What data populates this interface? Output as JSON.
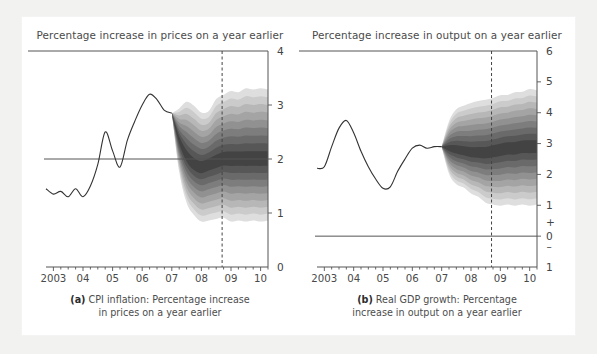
{
  "figure": {
    "background_color": "#ffffff",
    "outer_color": "#ededeb",
    "text_color": "#4a4a4a",
    "line_color": "#3a3a3a",
    "fan_dark": "#2d2d2d",
    "fan_light": "#d9d9d9"
  },
  "panels": [
    {
      "id": "a",
      "title": "Percentage increase in prices on a year earlier",
      "caption_line1_bold": "(a)",
      "caption_line1": "CPI inflation: Percentage increase",
      "caption_line2": "in prices on a year earlier",
      "y_axis_side": "right",
      "y_ticks": [
        "4",
        "3",
        "2",
        "1",
        "0"
      ],
      "x_ticks": [
        "2003",
        "04",
        "05",
        "06",
        "07",
        "08",
        "09",
        "10"
      ]
    },
    {
      "id": "b",
      "title": "Percentage increase in output on a year earlier",
      "caption_line1_bold": "(b)",
      "caption_line1": "Real GDP growth: Percentage",
      "caption_line2": "increase in output on a year earlier",
      "y_axis_side": "right",
      "y_ticks": [
        "6",
        "5",
        "4",
        "3",
        "2",
        "1",
        "+",
        "0",
        "–",
        "1"
      ],
      "x_ticks": [
        "2003",
        "04",
        "05",
        "06",
        "07",
        "08",
        "09",
        "10"
      ]
    }
  ],
  "chart_data": [
    {
      "type": "area",
      "panel": "a",
      "title": "Percentage increase in prices on a year earlier",
      "subtitle": "(a) CPI inflation: Percentage increase in prices on a year earlier",
      "xlabel": "",
      "ylabel": "Percentage increase in prices on a year earlier",
      "ylim": [
        0,
        4
      ],
      "xlim": [
        2002.75,
        2010.25
      ],
      "yticks": [
        0,
        1,
        2,
        3,
        4
      ],
      "xticks": [
        2003,
        2004,
        2005,
        2006,
        2007,
        2008,
        2009,
        2010
      ],
      "xtick_labels": [
        "2003",
        "04",
        "05",
        "06",
        "07",
        "08",
        "09",
        "10"
      ],
      "grid": false,
      "legend": "none",
      "reference_line_y": 2,
      "vertical_marker_x": 2008.7,
      "history": {
        "name": "CPI inflation (outturn)",
        "x": [
          2002.75,
          2003.0,
          2003.25,
          2003.5,
          2003.75,
          2004.0,
          2004.25,
          2004.5,
          2004.75,
          2005.0,
          2005.25,
          2005.5,
          2005.75,
          2006.0,
          2006.25,
          2006.5,
          2006.75,
          2007.0
        ],
        "y": [
          1.45,
          1.35,
          1.4,
          1.3,
          1.45,
          1.3,
          1.5,
          1.9,
          2.5,
          2.15,
          1.85,
          2.35,
          2.7,
          3.0,
          3.2,
          3.1,
          2.9,
          2.85
        ]
      },
      "fan": {
        "name": "CPI inflation projection",
        "x": [
          2007.0,
          2007.25,
          2007.5,
          2007.75,
          2008.0,
          2008.25,
          2008.5,
          2008.75,
          2009.0,
          2009.25,
          2009.5,
          2009.75,
          2010.0,
          2010.25
        ],
        "central": [
          2.85,
          2.35,
          2.05,
          1.9,
          1.85,
          1.9,
          1.95,
          2.0,
          2.0,
          2.0,
          2.0,
          2.0,
          2.0,
          2.0
        ],
        "bands_outer_upper": [
          2.85,
          2.95,
          3.05,
          3.0,
          2.85,
          2.9,
          3.1,
          3.2,
          3.25,
          3.25,
          3.3,
          3.3,
          3.3,
          3.3
        ],
        "bands_outer_lower": [
          2.85,
          1.75,
          1.2,
          0.95,
          0.85,
          0.85,
          0.9,
          0.9,
          0.85,
          0.85,
          0.85,
          0.85,
          0.85,
          0.85
        ],
        "band_count": 9
      }
    },
    {
      "type": "area",
      "panel": "b",
      "title": "Percentage increase in output on a year earlier",
      "subtitle": "(b) Real GDP growth: Percentage increase in output on a year earlier",
      "xlabel": "",
      "ylabel": "Percentage increase in output on a year earlier",
      "ylim": [
        -1,
        6
      ],
      "xlim": [
        2002.75,
        2010.25
      ],
      "yticks": [
        -1,
        0,
        1,
        2,
        3,
        4,
        5,
        6
      ],
      "ytick_labels": [
        "1",
        "0",
        "1",
        "2",
        "3",
        "4",
        "5",
        "6"
      ],
      "xticks": [
        2003,
        2004,
        2005,
        2006,
        2007,
        2008,
        2009,
        2010
      ],
      "xtick_labels": [
        "2003",
        "04",
        "05",
        "06",
        "07",
        "08",
        "09",
        "10"
      ],
      "grid": false,
      "legend": "none",
      "reference_line_y": 0,
      "vertical_marker_x": 2008.7,
      "history": {
        "name": "Real GDP growth (outturn)",
        "x": [
          2002.75,
          2003.0,
          2003.25,
          2003.5,
          2003.75,
          2004.0,
          2004.25,
          2004.5,
          2004.75,
          2005.0,
          2005.25,
          2005.5,
          2005.75,
          2006.0,
          2006.25,
          2006.5,
          2006.75,
          2007.0
        ],
        "y": [
          2.2,
          2.25,
          2.9,
          3.5,
          3.75,
          3.35,
          2.75,
          2.25,
          1.85,
          1.55,
          1.6,
          2.1,
          2.5,
          2.85,
          2.95,
          2.85,
          2.9,
          2.9
        ]
      },
      "fan": {
        "name": "Real GDP growth projection",
        "x": [
          2007.0,
          2007.25,
          2007.5,
          2007.75,
          2008.0,
          2008.25,
          2008.5,
          2008.75,
          2009.0,
          2009.25,
          2009.5,
          2009.75,
          2010.0,
          2010.25
        ],
        "central": [
          2.9,
          2.85,
          2.8,
          2.75,
          2.7,
          2.7,
          2.7,
          2.75,
          2.8,
          2.85,
          2.85,
          2.9,
          2.9,
          2.9
        ],
        "bands_outer_upper": [
          2.9,
          3.75,
          4.1,
          4.25,
          4.3,
          4.4,
          4.4,
          4.5,
          4.55,
          4.6,
          4.65,
          4.7,
          4.75,
          4.75
        ],
        "bands_outer_lower": [
          2.9,
          2.0,
          1.7,
          1.55,
          1.4,
          1.25,
          1.1,
          1.0,
          1.0,
          1.0,
          1.0,
          1.0,
          1.0,
          1.0
        ],
        "band_count": 9
      }
    }
  ]
}
